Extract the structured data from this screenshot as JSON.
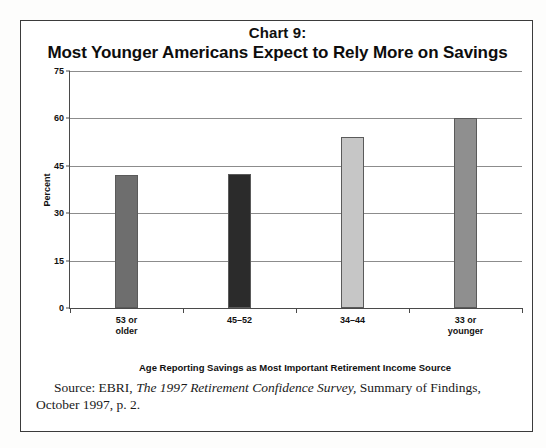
{
  "figure": {
    "title_line_1": "Chart 9:",
    "title_line_2": "Most Younger Americans Expect to Rely More on Savings"
  },
  "source": {
    "prefix": "Source: EBRI,",
    "italic_title": "The 1997 Retirement Confidence Survey,",
    "suffix": "Summary of Findings,",
    "line2": "October 1997, p. 2."
  },
  "chart_data": {
    "type": "bar",
    "title": "Chart 9: Most Younger Americans Expect to Rely More on Savings",
    "xlabel": "Age Reporting Savings as Most Important Retirement Income Source",
    "ylabel": "Percent",
    "ylim": [
      0,
      75
    ],
    "yticks": [
      0,
      15,
      30,
      45,
      60,
      75
    ],
    "ytick_labels": [
      "0",
      "15",
      "30",
      "45",
      "60",
      "75"
    ],
    "grid": true,
    "legend": false,
    "categories": [
      "53 or\nolder",
      "45–52",
      "34–44",
      "33 or\nyounger"
    ],
    "values": [
      42,
      42.5,
      54,
      60
    ],
    "bar_colors": [
      "#6e6e6e",
      "#2b2b2b",
      "#c6c6c6",
      "#8f8f8f"
    ]
  }
}
